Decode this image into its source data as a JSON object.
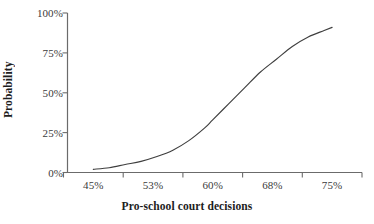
{
  "chart_data": {
    "type": "line",
    "title": "",
    "xlabel": "Pro-school court decisions",
    "ylabel": "Probability",
    "grid": false,
    "legend": "none",
    "xtick_labels": [
      "45%",
      "53%",
      "60%",
      "68%",
      "75%"
    ],
    "ytick_labels": [
      "0%",
      "25%",
      "50%",
      "75%",
      "100%"
    ],
    "ylim": [
      0,
      100
    ],
    "xlim": [
      41,
      79
    ],
    "x": [
      45,
      47,
      49,
      51,
      53,
      55,
      57,
      59,
      60,
      62,
      64,
      66,
      68,
      70,
      72,
      74,
      75
    ],
    "values": [
      2,
      3,
      5,
      7,
      10,
      14,
      20,
      28,
      33,
      43,
      53,
      63,
      71,
      79,
      85,
      89,
      91
    ],
    "series": [
      {
        "name": "Probability of pro-school outcome",
        "values": [
          2,
          3,
          5,
          7,
          10,
          14,
          20,
          28,
          33,
          43,
          53,
          63,
          71,
          79,
          85,
          89,
          91
        ]
      }
    ],
    "line_color": "#3f3f3f",
    "axis_color": "#6b6b6b"
  },
  "axes": {
    "y": {
      "title": "Probability",
      "ticks": [
        {
          "label": "100%",
          "value": 100
        },
        {
          "label": "75%",
          "value": 75
        },
        {
          "label": "50%",
          "value": 50
        },
        {
          "label": "25%",
          "value": 25
        },
        {
          "label": "0%",
          "value": 0
        }
      ]
    },
    "x": {
      "title": "Pro-school court decisions",
      "ticks": [
        {
          "label": "45%",
          "value": 45
        },
        {
          "label": "53%",
          "value": 53
        },
        {
          "label": "60%",
          "value": 60
        },
        {
          "label": "68%",
          "value": 68
        },
        {
          "label": "75%",
          "value": 75
        }
      ]
    }
  }
}
